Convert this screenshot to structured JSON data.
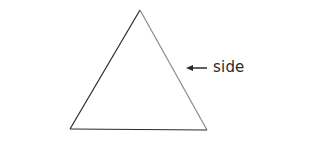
{
  "diagram": {
    "shape": "triangle",
    "vertices": [
      [
        140,
        10
      ],
      [
        70,
        129
      ],
      [
        207,
        130
      ]
    ],
    "stroke_left": "#2a2a2a",
    "stroke_right": "#8a8a8a",
    "stroke_base": "#2a2a2a",
    "annotation": {
      "label": "side",
      "arrow": "left-arrow",
      "points_to": "right side"
    }
  }
}
